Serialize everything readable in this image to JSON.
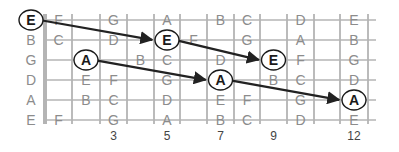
{
  "diagram": {
    "open_strings": [
      "E",
      "B",
      "G",
      "D",
      "A",
      "E"
    ],
    "fret_markers": [
      {
        "fret": 3,
        "label": "3"
      },
      {
        "fret": 5,
        "label": "5"
      },
      {
        "fret": 7,
        "label": "7"
      },
      {
        "fret": 9,
        "label": "9"
      },
      {
        "fret": 12,
        "label": "12"
      }
    ],
    "notes": [
      {
        "string": 0,
        "fret": 1,
        "label": "F"
      },
      {
        "string": 0,
        "fret": 3,
        "label": "G"
      },
      {
        "string": 0,
        "fret": 5,
        "label": "A"
      },
      {
        "string": 0,
        "fret": 7,
        "label": "B"
      },
      {
        "string": 0,
        "fret": 8,
        "label": "C"
      },
      {
        "string": 0,
        "fret": 10,
        "label": "D"
      },
      {
        "string": 0,
        "fret": 12,
        "label": "E"
      },
      {
        "string": 1,
        "fret": 1,
        "label": "C"
      },
      {
        "string": 1,
        "fret": 3,
        "label": "D"
      },
      {
        "string": 1,
        "fret": 6,
        "label": "F"
      },
      {
        "string": 1,
        "fret": 8,
        "label": "G"
      },
      {
        "string": 1,
        "fret": 10,
        "label": "A"
      },
      {
        "string": 1,
        "fret": 12,
        "label": "B"
      },
      {
        "string": 2,
        "fret": 4,
        "label": "B"
      },
      {
        "string": 2,
        "fret": 5,
        "label": "C"
      },
      {
        "string": 2,
        "fret": 7,
        "label": "D"
      },
      {
        "string": 2,
        "fret": 10,
        "label": "F"
      },
      {
        "string": 2,
        "fret": 12,
        "label": "G"
      },
      {
        "string": 3,
        "fret": 2,
        "label": "E"
      },
      {
        "string": 3,
        "fret": 3,
        "label": "F"
      },
      {
        "string": 3,
        "fret": 5,
        "label": "G"
      },
      {
        "string": 3,
        "fret": 9,
        "label": "B"
      },
      {
        "string": 3,
        "fret": 10,
        "label": "C"
      },
      {
        "string": 3,
        "fret": 12,
        "label": "D"
      },
      {
        "string": 4,
        "fret": 2,
        "label": "B"
      },
      {
        "string": 4,
        "fret": 3,
        "label": "C"
      },
      {
        "string": 4,
        "fret": 5,
        "label": "D"
      },
      {
        "string": 4,
        "fret": 7,
        "label": "E"
      },
      {
        "string": 4,
        "fret": 8,
        "label": "F"
      },
      {
        "string": 4,
        "fret": 10,
        "label": "G"
      },
      {
        "string": 5,
        "fret": 1,
        "label": "F"
      },
      {
        "string": 5,
        "fret": 3,
        "label": "G"
      },
      {
        "string": 5,
        "fret": 5,
        "label": "A"
      },
      {
        "string": 5,
        "fret": 7,
        "label": "B"
      },
      {
        "string": 5,
        "fret": 8,
        "label": "C"
      },
      {
        "string": 5,
        "fret": 10,
        "label": "D"
      },
      {
        "string": 5,
        "fret": 12,
        "label": "E"
      }
    ],
    "highlighted": [
      {
        "id": "E1",
        "string": 0,
        "fret": 0,
        "label": "E"
      },
      {
        "id": "E2",
        "string": 1,
        "fret": 5,
        "label": "E"
      },
      {
        "id": "E3",
        "string": 2,
        "fret": 9,
        "label": "E"
      },
      {
        "id": "A1",
        "string": 2,
        "fret": 2,
        "label": "A"
      },
      {
        "id": "A2",
        "string": 3,
        "fret": 7,
        "label": "A"
      },
      {
        "id": "A3",
        "string": 4,
        "fret": 12,
        "label": "A"
      }
    ],
    "arrows": [
      {
        "from": "E1",
        "to": "E2"
      },
      {
        "from": "E2",
        "to": "E3"
      },
      {
        "from": "A1",
        "to": "A2"
      },
      {
        "from": "A2",
        "to": "A3"
      }
    ],
    "colors": {
      "grid": "#b4b4b4",
      "note_text": "#8c8c8c",
      "highlight_text": "#1a1a1a",
      "arrow": "#222222"
    }
  }
}
